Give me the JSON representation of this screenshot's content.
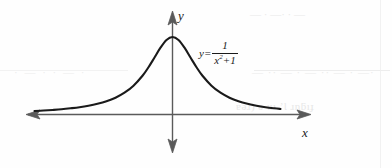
{
  "figure": {
    "background_color": "#fefefe",
    "curve_color": "#1a1a1a",
    "axis_color": "#4d4d4d"
  },
  "axes": {
    "x_label": "x",
    "y_label": "y",
    "x_axis_name": "horizontal-axis",
    "y_axis_name": "vertical-axis",
    "arrowheads": [
      "left",
      "right",
      "up",
      "down"
    ]
  },
  "equation": {
    "lhs": "y=",
    "numerator": "1",
    "denominator_base": "x",
    "denominator_exponent": "2",
    "denominator_tail": "+1",
    "plain_text": "y = 1/(x²+1)"
  },
  "artifacts": {
    "top": "— · —·  · —",
    "mid": "— ·· — · — ·· — · —·",
    "bottom": "ɐǝɹ) ǝ uı ’Ɩ ɹnƃıɟ",
    "left": "· — · · — ·"
  },
  "chart_data": {
    "type": "line",
    "xlabel": "x",
    "ylabel": "y",
    "grid": false,
    "legend": "none",
    "annotations": [
      {
        "text": "y = 1/(x²+1)",
        "x": 1.9,
        "y": 0.78
      }
    ],
    "xlim": [
      -4.6,
      3.6
    ],
    "ylim": [
      -0.45,
      1.28
    ],
    "series": [
      {
        "name": "y = 1/(x²+1)",
        "x": [
          -4.6,
          -4.3,
          -4.0,
          -3.7,
          -3.4,
          -3.1,
          -2.8,
          -2.5,
          -2.2,
          -1.9,
          -1.6,
          -1.3,
          -1.0,
          -0.8,
          -0.6,
          -0.4,
          -0.2,
          0.0,
          0.2,
          0.4,
          0.6,
          0.8,
          1.0,
          1.3,
          1.6,
          1.9,
          2.2,
          2.5,
          2.8,
          3.1,
          3.4,
          3.6
        ],
        "y": [
          0.045,
          0.051,
          0.059,
          0.068,
          0.08,
          0.094,
          0.113,
          0.138,
          0.171,
          0.217,
          0.281,
          0.372,
          0.5,
          0.61,
          0.735,
          0.862,
          0.962,
          1.0,
          0.962,
          0.862,
          0.735,
          0.61,
          0.5,
          0.372,
          0.281,
          0.217,
          0.171,
          0.138,
          0.113,
          0.094,
          0.08,
          0.072
        ]
      }
    ]
  }
}
